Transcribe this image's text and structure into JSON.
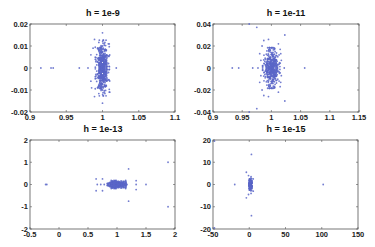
{
  "chart_data": [
    {
      "type": "scatter",
      "title": "h = 1e-9",
      "xlabel": "",
      "ylabel": "",
      "xlim": [
        0.9,
        1.1
      ],
      "ylim": [
        -0.02,
        0.02
      ],
      "xticks": [
        0.9,
        0.95,
        1,
        1.05,
        1.1
      ],
      "xtick_labels": [
        "0.9",
        "0.95",
        "1",
        "1.05",
        "1.1"
      ],
      "yticks": [
        -0.02,
        -0.01,
        0,
        0.01,
        0.02
      ],
      "ytick_labels": [
        "-0.02",
        "-0.01",
        "0",
        "0.01",
        "0.02"
      ],
      "grid": false,
      "marker_color": "#5a66c8",
      "cluster": {
        "cx": 1.0,
        "cy": 0.0,
        "sx": 0.004,
        "sy": 0.0055,
        "n": 260,
        "seed": 11
      },
      "points": [
        [
          0.915,
          0
        ],
        [
          0.929,
          0
        ],
        [
          0.932,
          0
        ],
        [
          0.968,
          0
        ],
        [
          0.98,
          0
        ],
        [
          1.019,
          0
        ],
        [
          1.0,
          0.016
        ],
        [
          1.0,
          -0.016
        ],
        [
          0.989,
          0.013
        ],
        [
          0.989,
          -0.013
        ],
        [
          0.987,
          0.009
        ],
        [
          0.985,
          -0.009
        ],
        [
          0.984,
          0.006
        ],
        [
          0.984,
          -0.006
        ],
        [
          1.008,
          0.011
        ],
        [
          1.01,
          -0.011
        ]
      ]
    },
    {
      "type": "scatter",
      "title": "h = 1e-11",
      "xlabel": "",
      "ylabel": "",
      "xlim": [
        0.9,
        1.15
      ],
      "ylim": [
        -0.04,
        0.04
      ],
      "xticks": [
        0.9,
        0.95,
        1,
        1.05,
        1.1,
        1.15
      ],
      "xtick_labels": [
        "0.9",
        "0.95",
        "1",
        "1.05",
        "1.1",
        "1.15"
      ],
      "yticks": [
        -0.04,
        -0.02,
        0,
        0.02,
        0.04
      ],
      "ytick_labels": [
        "-0.04",
        "-0.02",
        "0",
        "0.02",
        "0.04"
      ],
      "grid": false,
      "marker_color": "#5a66c8",
      "cluster": {
        "cx": 1.0,
        "cy": 0.0,
        "sx": 0.006,
        "sy": 0.008,
        "n": 240,
        "seed": 23
      },
      "points": [
        [
          0.933,
          0
        ],
        [
          0.944,
          0
        ],
        [
          0.968,
          0
        ],
        [
          0.977,
          0
        ],
        [
          1.022,
          0
        ],
        [
          1.057,
          0
        ],
        [
          0.962,
          0.04
        ],
        [
          0.975,
          0.037
        ],
        [
          1.023,
          0.03
        ],
        [
          0.975,
          -0.037
        ],
        [
          1.023,
          -0.03
        ],
        [
          0.962,
          -0.04
        ],
        [
          0.987,
          0.025
        ],
        [
          0.995,
          0.026
        ],
        [
          0.987,
          -0.025
        ],
        [
          0.995,
          -0.026
        ],
        [
          0.984,
          0.02
        ],
        [
          1.012,
          0.022
        ],
        [
          0.984,
          -0.02
        ],
        [
          1.012,
          -0.022
        ],
        [
          0.98,
          0.013
        ],
        [
          1.016,
          0.013
        ],
        [
          0.98,
          -0.013
        ],
        [
          1.016,
          -0.013
        ],
        [
          0.982,
          0.007
        ],
        [
          1.017,
          0.007
        ],
        [
          0.982,
          -0.007
        ],
        [
          1.017,
          -0.007
        ],
        [
          1.015,
          0.017
        ],
        [
          1.015,
          -0.017
        ]
      ]
    },
    {
      "type": "scatter",
      "title": "h = 1e-13",
      "xlabel": "",
      "ylabel": "",
      "xlim": [
        -0.5,
        2
      ],
      "ylim": [
        -2,
        2
      ],
      "xticks": [
        -0.5,
        0,
        0.5,
        1,
        1.5,
        2
      ],
      "xtick_labels": [
        "-0.5",
        "0",
        "0.5",
        "1",
        "1.5",
        "2"
      ],
      "yticks": [
        -2,
        -1,
        0,
        1,
        2
      ],
      "ytick_labels": [
        "-2",
        "-1",
        "0",
        "1",
        "2"
      ],
      "grid": false,
      "marker_color": "#5a66c8",
      "cluster": {
        "cx": 1.0,
        "cy": 0.0,
        "sx": 0.07,
        "sy": 0.08,
        "n": 180,
        "seed": 37
      },
      "points": [
        [
          -0.23,
          0
        ],
        [
          -0.21,
          0
        ],
        [
          0.66,
          0
        ],
        [
          0.72,
          0
        ],
        [
          0.78,
          0
        ],
        [
          1.33,
          0
        ],
        [
          1.5,
          0
        ],
        [
          0.64,
          0.25
        ],
        [
          0.75,
          0.25
        ],
        [
          0.64,
          -0.28
        ],
        [
          0.75,
          -0.28
        ],
        [
          1.2,
          0.7
        ],
        [
          1.2,
          -0.75
        ],
        [
          1.33,
          0.17
        ],
        [
          1.33,
          -0.23
        ],
        [
          1.88,
          1.0
        ],
        [
          1.88,
          -1.0
        ],
        [
          0.9,
          0.18
        ],
        [
          0.9,
          -0.18
        ],
        [
          1.15,
          0.18
        ],
        [
          1.15,
          -0.18
        ]
      ]
    },
    {
      "type": "scatter",
      "title": "h = 1e-15",
      "xlabel": "",
      "ylabel": "",
      "xlim": [
        -50,
        150
      ],
      "ylim": [
        -20,
        20
      ],
      "xticks": [
        -50,
        0,
        50,
        100,
        150
      ],
      "xtick_labels": [
        "-50",
        "0",
        "50",
        "100",
        "150"
      ],
      "yticks": [
        -20,
        -10,
        0,
        10,
        20
      ],
      "ytick_labels": [
        "-20",
        "-10",
        "0",
        "10",
        "20"
      ],
      "grid": false,
      "marker_color": "#5a66c8",
      "cluster": {
        "cx": 1.5,
        "cy": 0.0,
        "sx": 1.2,
        "sy": 1.3,
        "n": 90,
        "seed": 51
      },
      "points": [
        [
          -20,
          0
        ],
        [
          102,
          0
        ],
        [
          3,
          13.5
        ],
        [
          3,
          -14
        ],
        [
          -48,
          19.5
        ],
        [
          -48,
          -19.5
        ],
        [
          -4,
          5.5
        ],
        [
          -4,
          -6
        ],
        [
          -1,
          4
        ],
        [
          -1,
          -4.5
        ],
        [
          2.5,
          3.5
        ],
        [
          2.5,
          -4
        ],
        [
          5.5,
          2.5
        ],
        [
          5.5,
          -3
        ]
      ]
    }
  ],
  "panels": [
    {
      "title": "h = 1e-9"
    },
    {
      "title": "h = 1e-11"
    },
    {
      "title": "h = 1e-13"
    },
    {
      "title": "h = 1e-15"
    }
  ]
}
